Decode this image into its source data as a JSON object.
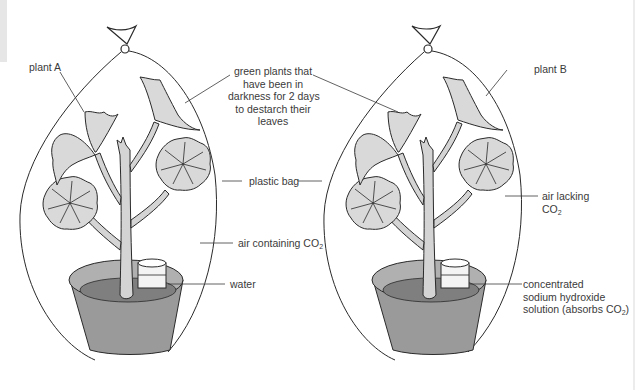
{
  "figure": {
    "colors": {
      "leaf_fill": "#d9d9d9",
      "stem_fill": "#d4d4d4",
      "pot_outer": "#9a9a9a",
      "pot_soil": "#7f7f7f",
      "pot_rim_inner": "#b0b0b0",
      "container_fill": "#f4f4f4",
      "line": "#2a2a2a",
      "text": "#3a3a3a"
    }
  },
  "labels": {
    "plant_a": "plant A",
    "plant_b": "plant B",
    "green_plants_line1": "green plants that",
    "green_plants_line2": "have been in",
    "green_plants_line3": "darkness for 2 days",
    "green_plants_line4": "to destarch their",
    "green_plants_line5": "leaves",
    "plastic_bag": "plastic bag",
    "air_containing": "air containing CO",
    "air_containing_sub": "2",
    "water": "water",
    "air_lacking_line1": "air lacking",
    "air_lacking_line2": "CO",
    "air_lacking_sub": "2",
    "naoh_line1": "concentrated",
    "naoh_line2": "sodium hydroxide",
    "naoh_line3": "solution (absorbs CO",
    "naoh_sub": "2",
    "naoh_close": ")"
  },
  "setups": [
    {
      "name": "plant A",
      "container": "water",
      "air": "air containing CO2"
    },
    {
      "name": "plant B",
      "container": "concentrated sodium hydroxide solution",
      "air": "air lacking CO2"
    }
  ]
}
